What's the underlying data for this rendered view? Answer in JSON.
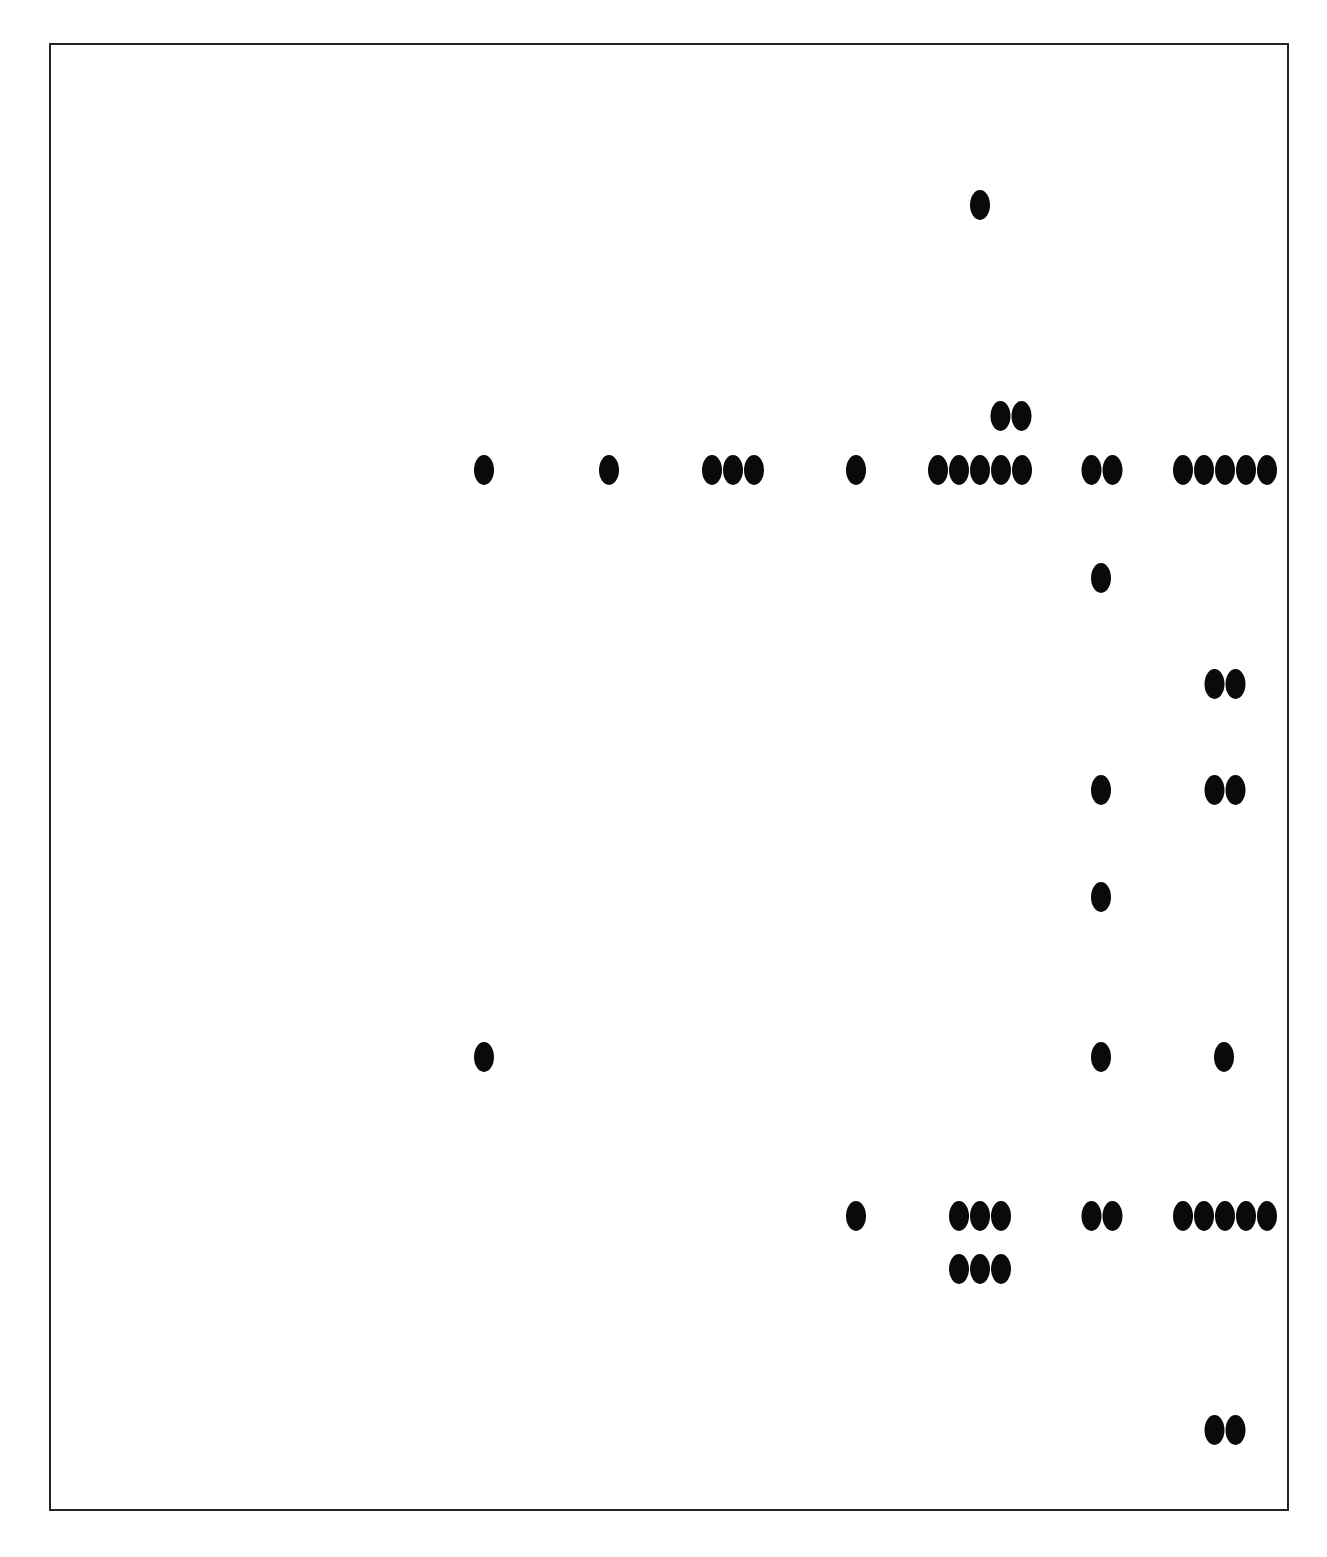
{
  "colors": {
    "dot": "#0a0a0a",
    "frame": "#222222",
    "background": "#ffffff"
  },
  "chart_data": {
    "type": "scatter",
    "title": "",
    "xlabel": "",
    "ylabel": "",
    "grid": false,
    "legend": null,
    "groups": [
      {
        "x": 980,
        "y": 205,
        "count": 1
      },
      {
        "x": 1011,
        "y": 416,
        "count": 2
      },
      {
        "x": 484,
        "y": 470,
        "count": 1
      },
      {
        "x": 609,
        "y": 470,
        "count": 1
      },
      {
        "x": 733,
        "y": 470,
        "count": 3
      },
      {
        "x": 856,
        "y": 470,
        "count": 1
      },
      {
        "x": 980,
        "y": 470,
        "count": 5
      },
      {
        "x": 1102,
        "y": 470,
        "count": 2
      },
      {
        "x": 1225,
        "y": 470,
        "count": 5
      },
      {
        "x": 1101,
        "y": 578,
        "count": 1
      },
      {
        "x": 1225,
        "y": 684,
        "count": 2
      },
      {
        "x": 1101,
        "y": 790,
        "count": 1
      },
      {
        "x": 1225,
        "y": 790,
        "count": 2
      },
      {
        "x": 1101,
        "y": 897,
        "count": 1
      },
      {
        "x": 484,
        "y": 1057,
        "count": 1
      },
      {
        "x": 1101,
        "y": 1057,
        "count": 1
      },
      {
        "x": 1224,
        "y": 1057,
        "count": 1
      },
      {
        "x": 856,
        "y": 1216,
        "count": 1
      },
      {
        "x": 980,
        "y": 1216,
        "count": 3
      },
      {
        "x": 1102,
        "y": 1216,
        "count": 2
      },
      {
        "x": 1225,
        "y": 1216,
        "count": 5
      },
      {
        "x": 980,
        "y": 1269,
        "count": 3
      },
      {
        "x": 1225,
        "y": 1430,
        "count": 2
      }
    ]
  }
}
